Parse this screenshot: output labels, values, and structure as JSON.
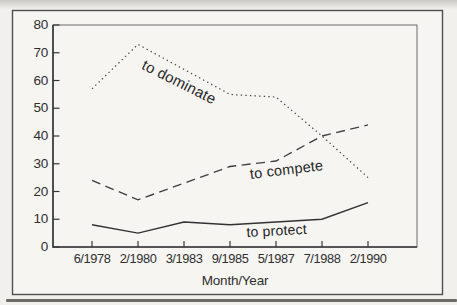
{
  "figure": {
    "xlabel": "Month/Year"
  },
  "chart_data": {
    "type": "line",
    "categories": [
      "6/1978",
      "2/1980",
      "3/1983",
      "9/1985",
      "5/1987",
      "7/1988",
      "2/1990"
    ],
    "series": [
      {
        "name": "to dominate",
        "line_style": "dotted",
        "values": [
          57,
          73,
          64,
          55,
          54,
          40,
          25
        ]
      },
      {
        "name": "to compete",
        "line_style": "dashed",
        "values": [
          24,
          17,
          23,
          29,
          31,
          40,
          44
        ]
      },
      {
        "name": "to protect",
        "line_style": "solid",
        "values": [
          8,
          5,
          9,
          8,
          9,
          10,
          16
        ]
      }
    ],
    "title": "",
    "xlabel": "Month/Year",
    "ylabel": "",
    "ylim": [
      0,
      80
    ],
    "yticks": [
      0,
      10,
      20,
      30,
      40,
      50,
      60,
      70,
      80
    ],
    "grid": false,
    "legend_position": "inline-labels-on-lines"
  },
  "colors": {
    "paper": "#f6f5f2",
    "page_background": "#f1f0ed",
    "figure_border": "#4e4e4e",
    "axis": "#383838",
    "line_dominate": "#4a4a4a",
    "line_compete": "#3f3f3f",
    "line_protect": "#323232",
    "text": "#2e2e2e"
  }
}
